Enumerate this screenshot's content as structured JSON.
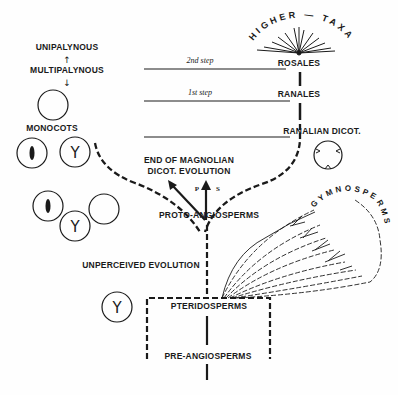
{
  "diagram": {
    "labels": {
      "unipalynous": "UNIPALYNOUS",
      "multipalynous": "MULTIPALYNOUS",
      "monocots": "MONOCOTS",
      "rosales": "ROSALES",
      "ranales": "RANALES",
      "ranalian_dicot": "RANALIAN DICOT.",
      "end_magnolian_1": "END OF MAGNOLIAN",
      "end_magnolian_2": "DICOT. EVOLUTION",
      "proto_angiosperms": "PROTO-ANGIOSPERMS",
      "unperceived_evolution": "UNPERCEIVED EVOLUTION",
      "pteridosperms": "PTERIDOSPERMS",
      "pre_angiosperms": "PRE-ANGIOSPERMS",
      "higher_taxa": "HIGHER — TAXA",
      "gymnosperms": "GYMNOSPERMS",
      "arrow_p": "P",
      "arrow_s": "S"
    },
    "steps": {
      "second": "2nd step",
      "first": "1st step"
    },
    "pollen_glyphs": {
      "trichotomocolpate": "Y",
      "arrow_up": "↑",
      "arrow_down": "↓"
    }
  }
}
